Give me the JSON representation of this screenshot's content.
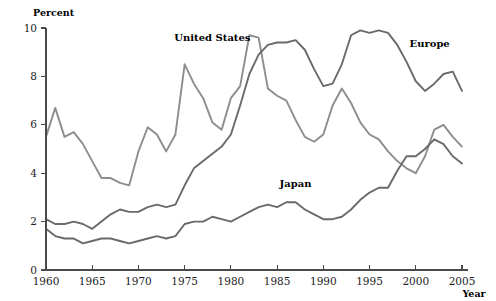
{
  "chart_data": {
    "type": "line",
    "title": "",
    "subtitle": "",
    "xlabel": "Year",
    "ylabel": "Percent",
    "xlim": [
      1960,
      2005
    ],
    "ylim": [
      0,
      10
    ],
    "grid": false,
    "legend_position": "inline-annotations",
    "y_ticks": [
      0,
      2,
      4,
      6,
      8,
      10
    ],
    "y_tick_labels": [
      "0",
      "2",
      "4",
      "6",
      "8",
      "10"
    ],
    "x_ticks": [
      1960,
      1965,
      1970,
      1975,
      1980,
      1985,
      1990,
      1995,
      2000,
      2005
    ],
    "x_tick_labels": [
      "1960",
      "1965",
      "1970",
      "1975",
      "1980",
      "1985",
      "1990",
      "1995",
      "2000",
      "2005"
    ],
    "x": [
      1960,
      1961,
      1962,
      1963,
      1964,
      1965,
      1966,
      1967,
      1968,
      1969,
      1970,
      1971,
      1972,
      1973,
      1974,
      1975,
      1976,
      1977,
      1978,
      1979,
      1980,
      1981,
      1982,
      1983,
      1984,
      1985,
      1986,
      1987,
      1988,
      1989,
      1990,
      1991,
      1992,
      1993,
      1994,
      1995,
      1996,
      1997,
      1998,
      1999,
      2000,
      2001,
      2002,
      2003,
      2004,
      2005
    ],
    "series": [
      {
        "name": "United States",
        "color": "#8d8d8d",
        "label_x": 1978.0,
        "label_y": 9.45,
        "values": [
          5.5,
          6.7,
          5.5,
          5.7,
          5.2,
          4.5,
          3.8,
          3.8,
          3.6,
          3.5,
          4.9,
          5.9,
          5.6,
          4.9,
          5.6,
          8.5,
          7.7,
          7.1,
          6.1,
          5.8,
          7.1,
          7.6,
          9.7,
          9.6,
          7.5,
          7.2,
          7.0,
          6.2,
          5.5,
          5.3,
          5.6,
          6.8,
          7.5,
          6.9,
          6.1,
          5.6,
          5.4,
          4.9,
          4.5,
          4.2,
          4.0,
          4.7,
          5.8,
          6.0,
          5.5,
          5.1
        ],
        "visual_points": [
          [
            1960,
            5.5
          ],
          [
            1961,
            6.7
          ],
          [
            1962,
            5.5
          ],
          [
            1963,
            5.7
          ],
          [
            1964,
            5.2
          ],
          [
            1965,
            4.5
          ],
          [
            1966,
            3.8
          ],
          [
            1967,
            3.8
          ],
          [
            1968,
            3.6
          ],
          [
            1969,
            3.5
          ],
          [
            1970,
            4.9
          ],
          [
            1971,
            5.9
          ],
          [
            1972,
            5.6
          ],
          [
            1973,
            4.9
          ],
          [
            1974,
            5.6
          ],
          [
            1975,
            8.5
          ],
          [
            1976,
            7.7
          ],
          [
            1977,
            7.1
          ],
          [
            1978,
            6.1
          ],
          [
            1979,
            5.8
          ],
          [
            1980,
            7.1
          ],
          [
            1981,
            7.6
          ],
          [
            1982,
            9.7
          ],
          [
            1983,
            9.6
          ],
          [
            1984,
            7.5
          ],
          [
            1985,
            7.2
          ],
          [
            1986,
            7.0
          ],
          [
            1987,
            6.2
          ],
          [
            1988,
            5.5
          ],
          [
            1989,
            5.3
          ],
          [
            1990,
            5.6
          ],
          [
            1991,
            6.8
          ],
          [
            1992,
            7.5
          ],
          [
            1993,
            6.9
          ],
          [
            1994,
            6.1
          ],
          [
            1995,
            5.6
          ],
          [
            1996,
            5.4
          ],
          [
            1997,
            4.9
          ],
          [
            1998,
            4.5
          ],
          [
            1999,
            4.2
          ],
          [
            2000,
            4.0
          ],
          [
            2001,
            4.7
          ],
          [
            2002,
            5.8
          ],
          [
            2003,
            6.0
          ],
          [
            2004,
            5.5
          ],
          [
            2005,
            5.1
          ]
        ]
      },
      {
        "name": "Europe",
        "color": "#6a6a6a",
        "label_x": 2001.5,
        "label_y": 9.2,
        "values": [
          2.1,
          1.9,
          1.9,
          2.0,
          1.9,
          1.7,
          2.0,
          2.3,
          2.5,
          2.4,
          2.4,
          2.6,
          2.7,
          2.6,
          2.7,
          3.5,
          4.2,
          4.5,
          4.8,
          5.1,
          5.6,
          6.8,
          8.1,
          8.9,
          9.3,
          9.4,
          9.4,
          9.5,
          9.1,
          8.3,
          7.6,
          7.7,
          8.5,
          9.7,
          9.9,
          9.8,
          9.9,
          9.8,
          9.3,
          8.6,
          7.8,
          7.4,
          7.7,
          8.1,
          8.2,
          7.4
        ],
        "visual_points": [
          [
            1960,
            2.1
          ],
          [
            1961,
            1.9
          ],
          [
            1962,
            1.9
          ],
          [
            1963,
            2.0
          ],
          [
            1964,
            1.9
          ],
          [
            1965,
            1.7
          ],
          [
            1966,
            2.0
          ],
          [
            1967,
            2.3
          ],
          [
            1968,
            2.5
          ],
          [
            1969,
            2.4
          ],
          [
            1970,
            2.4
          ],
          [
            1971,
            2.6
          ],
          [
            1972,
            2.7
          ],
          [
            1973,
            2.6
          ],
          [
            1974,
            2.7
          ],
          [
            1975,
            3.5
          ],
          [
            1976,
            4.2
          ],
          [
            1977,
            4.5
          ],
          [
            1978,
            4.8
          ],
          [
            1979,
            5.1
          ],
          [
            1980,
            5.6
          ],
          [
            1981,
            6.8
          ],
          [
            1982,
            8.1
          ],
          [
            1983,
            8.9
          ],
          [
            1984,
            9.3
          ],
          [
            1985,
            9.4
          ],
          [
            1986,
            9.4
          ],
          [
            1987,
            9.5
          ],
          [
            1988,
            9.1
          ],
          [
            1989,
            8.3
          ],
          [
            1990,
            7.6
          ],
          [
            1991,
            7.7
          ],
          [
            1992,
            8.5
          ],
          [
            1993,
            9.7
          ],
          [
            1994,
            9.9
          ],
          [
            1995,
            9.8
          ],
          [
            1996,
            9.9
          ],
          [
            1997,
            9.8
          ],
          [
            1998,
            9.3
          ],
          [
            1999,
            8.6
          ],
          [
            2000,
            7.8
          ],
          [
            2001,
            7.4
          ],
          [
            2002,
            7.7
          ],
          [
            2003,
            8.1
          ],
          [
            2004,
            8.2
          ],
          [
            2005,
            7.4
          ]
        ]
      },
      {
        "name": "Japan",
        "color": "#6a6a6a",
        "label_x": 1987.0,
        "label_y": 3.45,
        "values": [
          1.7,
          1.4,
          1.3,
          1.3,
          1.1,
          1.2,
          1.3,
          1.3,
          1.2,
          1.1,
          1.2,
          1.3,
          1.4,
          1.3,
          1.4,
          1.9,
          2.0,
          2.0,
          2.2,
          2.1,
          2.0,
          2.2,
          2.4,
          2.6,
          2.7,
          2.6,
          2.8,
          2.8,
          2.5,
          2.3,
          2.1,
          2.1,
          2.2,
          2.5,
          2.9,
          3.2,
          3.4,
          3.4,
          4.1,
          4.7,
          4.7,
          5.0,
          5.4,
          5.2,
          4.7,
          4.4
        ],
        "visual_points": [
          [
            1960,
            1.7
          ],
          [
            1961,
            1.4
          ],
          [
            1962,
            1.3
          ],
          [
            1963,
            1.3
          ],
          [
            1964,
            1.1
          ],
          [
            1965,
            1.2
          ],
          [
            1966,
            1.3
          ],
          [
            1967,
            1.3
          ],
          [
            1968,
            1.2
          ],
          [
            1969,
            1.1
          ],
          [
            1970,
            1.2
          ],
          [
            1971,
            1.3
          ],
          [
            1972,
            1.4
          ],
          [
            1973,
            1.3
          ],
          [
            1974,
            1.4
          ],
          [
            1975,
            1.9
          ],
          [
            1976,
            2.0
          ],
          [
            1977,
            2.0
          ],
          [
            1978,
            2.2
          ],
          [
            1979,
            2.1
          ],
          [
            1980,
            2.0
          ],
          [
            1981,
            2.2
          ],
          [
            1982,
            2.4
          ],
          [
            1983,
            2.6
          ],
          [
            1984,
            2.7
          ],
          [
            1985,
            2.6
          ],
          [
            1986,
            2.8
          ],
          [
            1987,
            2.8
          ],
          [
            1988,
            2.5
          ],
          [
            1989,
            2.3
          ],
          [
            1990,
            2.1
          ],
          [
            1991,
            2.1
          ],
          [
            1992,
            2.2
          ],
          [
            1993,
            2.5
          ],
          [
            1994,
            2.9
          ],
          [
            1995,
            3.2
          ],
          [
            1996,
            3.4
          ],
          [
            1997,
            3.4
          ],
          [
            1998,
            4.1
          ],
          [
            1999,
            4.7
          ],
          [
            2000,
            4.7
          ],
          [
            2001,
            5.0
          ],
          [
            2002,
            5.4
          ],
          [
            2003,
            5.2
          ],
          [
            2004,
            4.7
          ],
          [
            2005,
            4.4
          ]
        ]
      }
    ],
    "annotations": [
      {
        "text": "United States",
        "x": 1978.0,
        "y": 9.45
      },
      {
        "text": "Europe",
        "x": 2001.5,
        "y": 9.2
      },
      {
        "text": "Japan",
        "x": 1987.0,
        "y": 3.45
      }
    ],
    "axis_color": "#4a4a4a"
  }
}
